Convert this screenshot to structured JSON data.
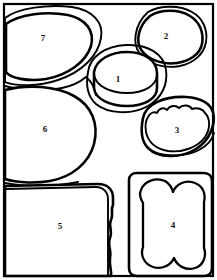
{
  "figure": {
    "canvas": {
      "width": 217,
      "height": 280
    },
    "background_color": "#ffffff",
    "stroke_color": "#000000",
    "frame": {
      "visible": true,
      "x": 4,
      "y": 4,
      "width": 209,
      "height": 272
    }
  },
  "regions": [
    {
      "id": "region-1",
      "label": "1",
      "shape": "cylinder-outline-with-halo",
      "label_x": 118,
      "label_y": 79,
      "description": "Round cup/can seen at an angle, double outline"
    },
    {
      "id": "region-2",
      "label": "2",
      "shape": "rounded-blob-double-contour",
      "label_x": 166,
      "label_y": 36,
      "description": "Irregular rounded blob, top right"
    },
    {
      "id": "region-3",
      "label": "3",
      "shape": "ellipse-with-jagged-inner-contour",
      "label_x": 177,
      "label_y": 130,
      "description": "Oval with wavy inner edge, right middle"
    },
    {
      "id": "region-4",
      "label": "4",
      "shape": "rounded-rect-with-lobed-inner",
      "label_x": 173,
      "label_y": 225,
      "description": "Rounded rectangle containing a lobed bread-like inner shape"
    },
    {
      "id": "region-5",
      "label": "5",
      "shape": "rounded-rect-clipped-bottom-left",
      "label_x": 60,
      "label_y": 226,
      "description": "Large rounded rectangle with wavy right edge, clipped by frame"
    },
    {
      "id": "region-6",
      "label": "6",
      "shape": "large-rounded-blob-clipped-left",
      "label_x": 45,
      "label_y": 129,
      "description": "Large rounded shape at left middle, clipped by frame"
    },
    {
      "id": "region-7",
      "label": "7",
      "shape": "ellipse-double-contour-clipped-left",
      "label_x": 43,
      "label_y": 38,
      "description": "Oval plate with double outline, top left"
    }
  ]
}
